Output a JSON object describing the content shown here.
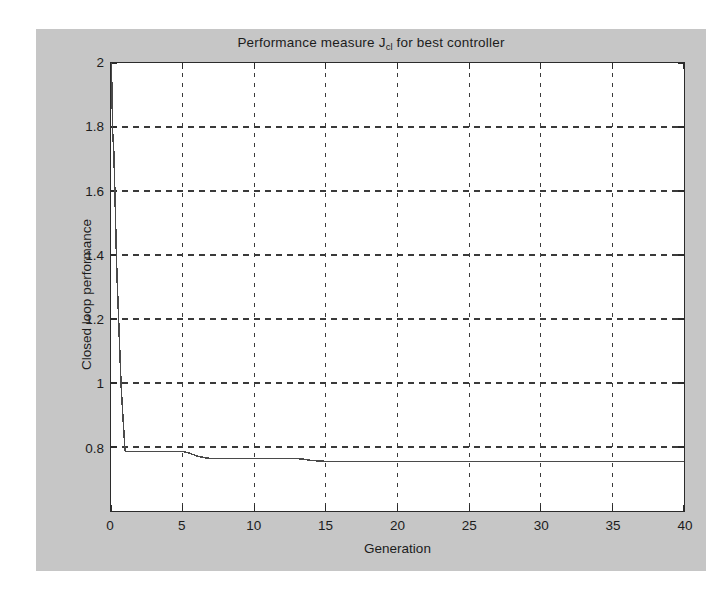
{
  "figure": {
    "background_color": "#c6c6c6",
    "axes_background_color": "#ffffff",
    "axes_border_color": "#2b2b2b",
    "grid_color": "#3a3a3a",
    "line_color": "#4a4a4a",
    "title_main": "Performance measure J",
    "title_sub": "cl",
    "title_tail": " for best controller",
    "title_full": "Performance measure J_cl for best controller"
  },
  "chart_data": {
    "type": "line",
    "xlabel": "Generation",
    "ylabel": "Closed loop performance",
    "xlim": [
      0,
      40
    ],
    "ylim": [
      0.6,
      2
    ],
    "xticks": [
      0,
      5,
      10,
      15,
      20,
      25,
      30,
      35,
      40
    ],
    "xtick_labels": [
      "0",
      "5",
      "10",
      "15",
      "20",
      "25",
      "30",
      "35",
      "40"
    ],
    "yticks": [
      0.8,
      1,
      1.2,
      1.4,
      1.6,
      1.8,
      2
    ],
    "ytick_labels": [
      "0.8",
      "1",
      "1.2",
      "1.4",
      "1.6",
      "1.8",
      "2"
    ],
    "grid": true,
    "grid_style": "dashed",
    "legend": null,
    "series": [
      {
        "name": "Closed loop performance of best controller",
        "x": [
          0,
          0.05,
          0.12,
          0.2,
          0.28,
          0.35,
          0.42,
          0.5,
          0.58,
          0.65,
          0.72,
          0.8,
          0.88,
          0.95,
          1,
          5,
          5.4,
          6,
          6.6,
          7,
          13,
          13.4,
          14,
          15,
          16,
          40
        ],
        "y": [
          2,
          1.95,
          1.78,
          1.72,
          1.58,
          1.45,
          1.33,
          1.24,
          1.14,
          1.06,
          0.98,
          0.92,
          0.86,
          0.81,
          0.786,
          0.786,
          0.782,
          0.772,
          0.766,
          0.764,
          0.764,
          0.762,
          0.758,
          0.755,
          0.7545,
          0.7545
        ]
      }
    ]
  },
  "axis_titles": {
    "x": "Generation",
    "y": "Closed loop performance"
  }
}
